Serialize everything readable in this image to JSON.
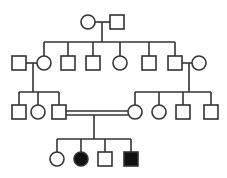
{
  "diagram": {
    "type": "pedigree",
    "colors": {
      "line": "#333333",
      "affected": "#111111",
      "unaffected": "#ffffff"
    },
    "generations": [
      {
        "id": "I",
        "individuals": [
          {
            "id": "I-1",
            "sex": "female",
            "affected": false
          },
          {
            "id": "I-2",
            "sex": "male",
            "affected": false
          }
        ]
      },
      {
        "id": "II",
        "individuals": [
          {
            "id": "II-spouse-1",
            "sex": "male",
            "affected": false
          },
          {
            "id": "II-1",
            "sex": "female",
            "affected": false
          },
          {
            "id": "II-2",
            "sex": "male",
            "affected": false
          },
          {
            "id": "II-3",
            "sex": "male",
            "affected": false
          },
          {
            "id": "II-4",
            "sex": "female",
            "affected": false
          },
          {
            "id": "II-5",
            "sex": "male",
            "affected": false
          },
          {
            "id": "II-6",
            "sex": "male",
            "affected": false
          },
          {
            "id": "II-spouse-2",
            "sex": "female",
            "affected": false
          }
        ]
      },
      {
        "id": "III",
        "individuals": [
          {
            "id": "III-1",
            "sex": "male",
            "affected": false
          },
          {
            "id": "III-2",
            "sex": "female",
            "affected": false
          },
          {
            "id": "III-3",
            "sex": "male",
            "affected": false
          },
          {
            "id": "III-4",
            "sex": "female",
            "affected": false
          },
          {
            "id": "III-5",
            "sex": "female",
            "affected": false
          },
          {
            "id": "III-6",
            "sex": "male",
            "affected": false
          },
          {
            "id": "III-7",
            "sex": "male",
            "affected": false
          }
        ]
      },
      {
        "id": "IV",
        "individuals": [
          {
            "id": "IV-1",
            "sex": "female",
            "affected": false
          },
          {
            "id": "IV-2",
            "sex": "female",
            "affected": true
          },
          {
            "id": "IV-3",
            "sex": "male",
            "affected": false
          },
          {
            "id": "IV-4",
            "sex": "male",
            "affected": true
          }
        ]
      }
    ],
    "consanguineous_mating": [
      "III-3",
      "III-4"
    ]
  }
}
